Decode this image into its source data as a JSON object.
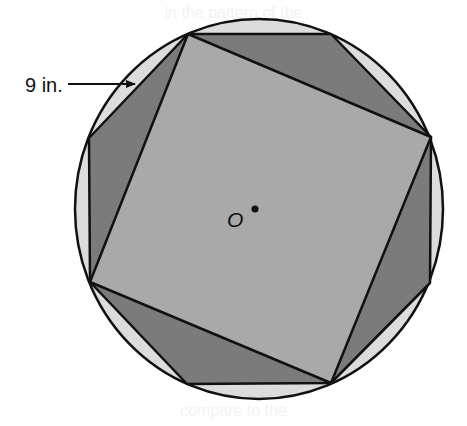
{
  "figure": {
    "measure_label": "9 in.",
    "center_label": "O",
    "bleed_top": "in the pattern of the",
    "bleed_bottom": "compare to the",
    "colors": {
      "background": "#ffffff",
      "circle_fill": "#dcdcdc",
      "octagon_fill": "#7b7b7b",
      "square_fill": "#a9a9a9",
      "stroke": "#111111"
    },
    "circle": {
      "cx": 259,
      "cy": 209,
      "rx": 184,
      "ry": 190
    },
    "octagon_points": "188,34 331,34 431,137 430,283 331,383 187,384 90,282 89,138",
    "square_points": "188,34 431,137 331,383 90,282",
    "center_point": {
      "x": 255,
      "y": 209
    },
    "arrow": {
      "x1": 68,
      "y1": 84,
      "x2": 135,
      "y2": 84
    }
  }
}
